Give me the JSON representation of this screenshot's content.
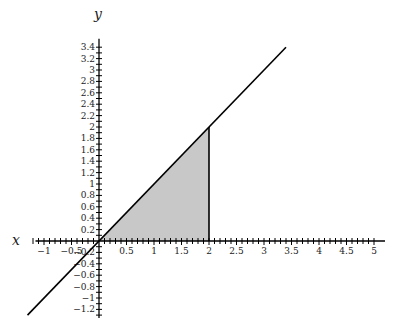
{
  "chart_data": {
    "type": "line",
    "title": "",
    "xlabel": "x",
    "ylabel": "y",
    "grid": false,
    "legend": null,
    "xlim": [
      -1.3,
      5.2
    ],
    "ylim": [
      -1.35,
      3.55
    ],
    "x_ticks": [
      -1,
      -0.5,
      0.5,
      1,
      1.5,
      2,
      2.5,
      3,
      3.5,
      4,
      4.5,
      5
    ],
    "x_tick_labels": [
      "−1",
      "−0.5",
      "0.5",
      "1",
      "1.5",
      "2",
      "2.5",
      "3",
      "3.5",
      "4",
      "4.5",
      "5"
    ],
    "x_minor_step": 0.1,
    "y_ticks": [
      -1.2,
      -1,
      -0.8,
      -0.6,
      -0.4,
      -0.2,
      0.2,
      0.4,
      0.6,
      0.8,
      1,
      1.2,
      1.4,
      1.6,
      1.8,
      2,
      2.2,
      2.4,
      2.6,
      2.8,
      3,
      3.2,
      3.4
    ],
    "y_tick_labels": [
      "−1.2",
      "−1",
      "−0.8",
      "−0.6",
      "−0.4",
      "−0.2",
      "0.2",
      "0.4",
      "0.6",
      "0.8",
      "1",
      "1.2",
      "1.4",
      "1.6",
      "1.8",
      "2",
      "2.2",
      "2.4",
      "2.6",
      "2.8",
      "3",
      "3.2",
      "3.4"
    ],
    "y_minor_step": 0.1,
    "series": [
      {
        "name": "y = x",
        "type": "line",
        "x": [
          -1.3,
          3.4
        ],
        "y": [
          -1.3,
          3.4
        ],
        "color": "#000000"
      }
    ],
    "shaded_region": {
      "description": "area under y = x from x = 0 to x = 2",
      "vertices": [
        [
          0,
          0
        ],
        [
          2,
          2
        ],
        [
          2,
          0
        ]
      ],
      "fill": "#c8c8c8",
      "boundary_line_x": 2
    }
  },
  "layout": {
    "origin_px": [
      99,
      241
    ],
    "unit_px_x": 55,
    "unit_px_y": 57
  }
}
